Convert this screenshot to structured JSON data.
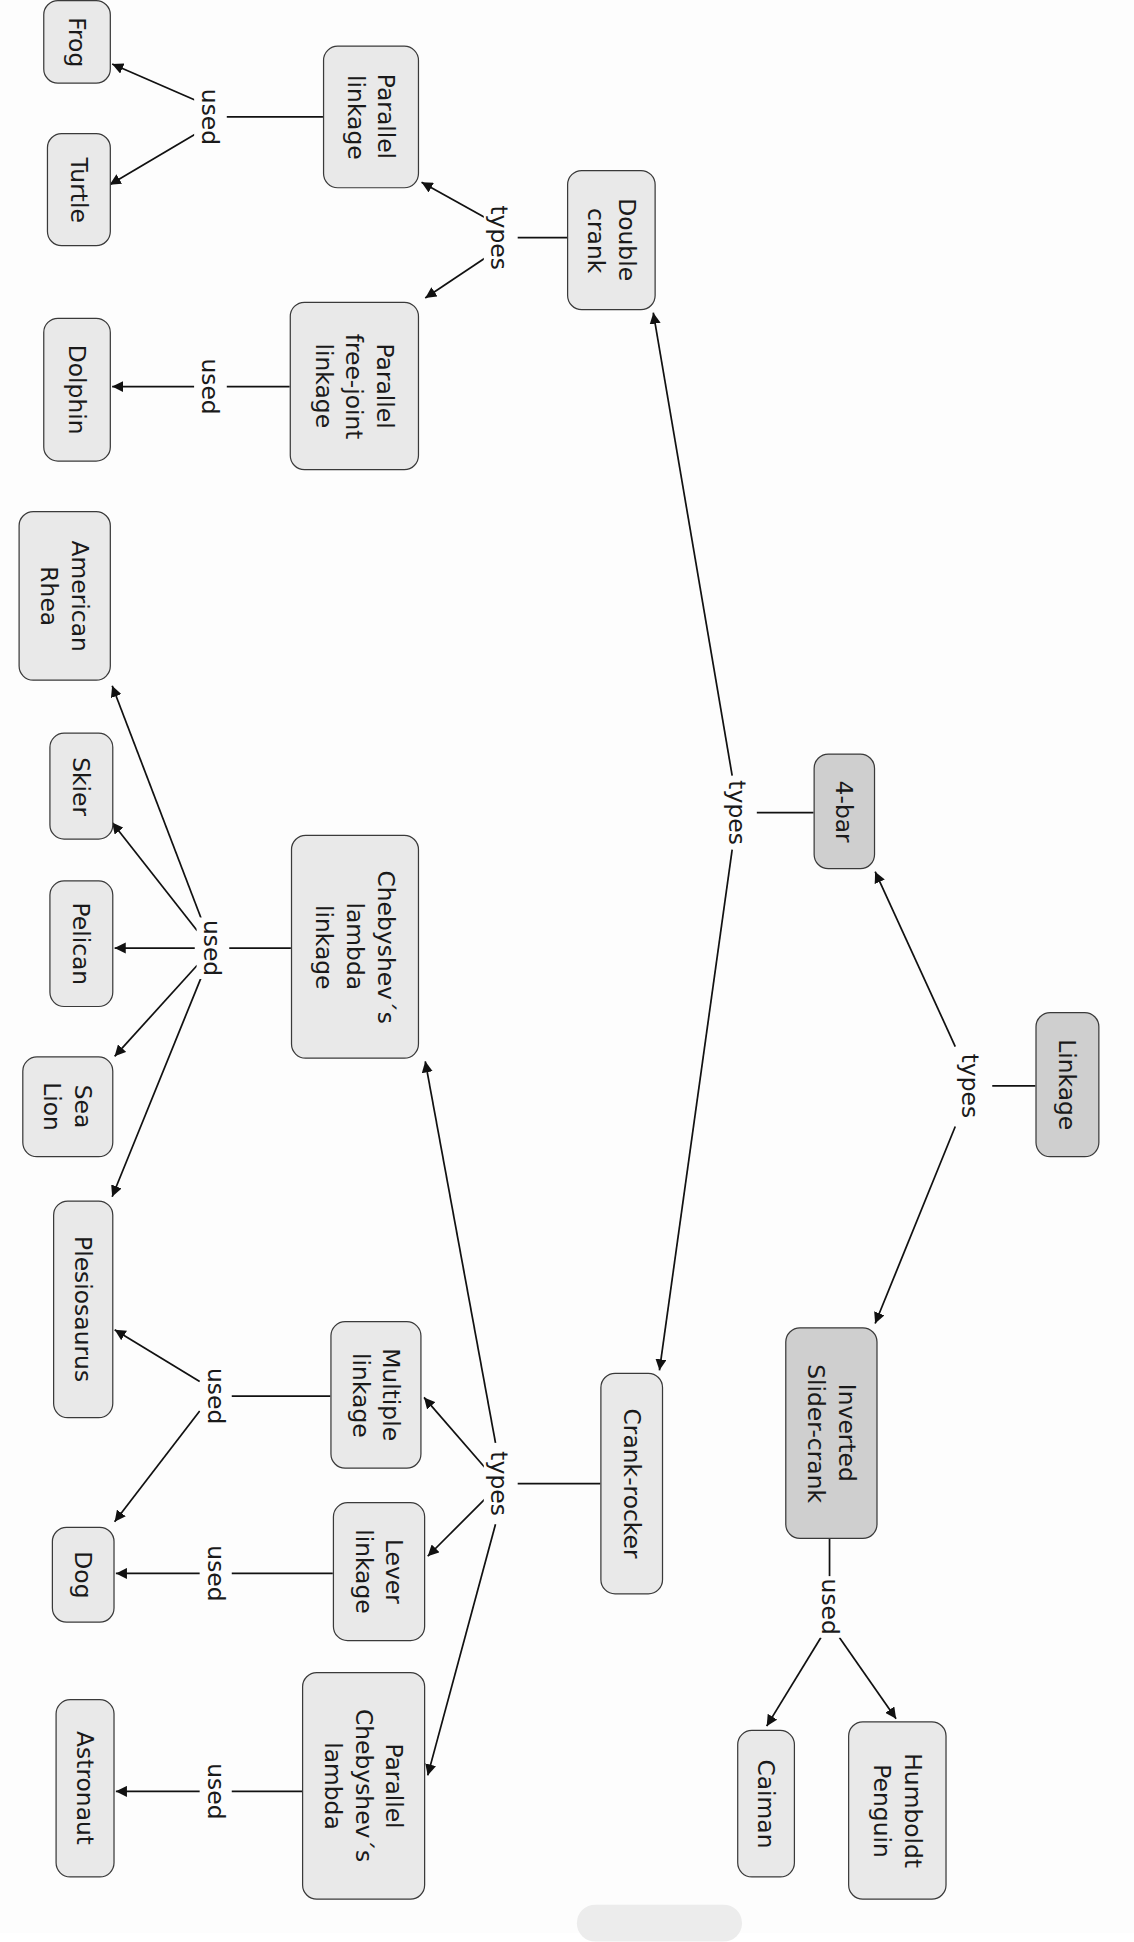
{
  "diagram": {
    "type": "concept-map",
    "orientation": "rotated-90-cw",
    "colors": {
      "node_fill": "#e9e9e9",
      "node_fill_dark": "#cfcfcf",
      "stroke": "#3a3a3a",
      "text": "#1a1a1a"
    },
    "nodes": [
      {
        "id": "linkage",
        "label": "Linkage",
        "box": [
          840,
          822,
          892,
          940
        ],
        "dark": true
      },
      {
        "id": "four_bar",
        "label": "4-bar",
        "box": [
          660,
          612,
          710,
          706
        ],
        "dark": true
      },
      {
        "id": "inverted_slider_crank",
        "label": "Inverted\nSlider-crank",
        "box": [
          637,
          1078,
          712,
          1250
        ],
        "dark": true
      },
      {
        "id": "double_crank",
        "label": "Double\ncrank",
        "box": [
          460,
          138,
          532,
          252
        ],
        "dark": false
      },
      {
        "id": "crank_rocker",
        "label": "Crank-rocker",
        "box": [
          487,
          1115,
          538,
          1295
        ],
        "dark": false
      },
      {
        "id": "parallel_linkage",
        "label": "Parallel\nlinkage",
        "box": [
          262,
          37,
          340,
          153
        ],
        "dark": false
      },
      {
        "id": "parallel_free_joint_linkage",
        "label": "Parallel\nfree-joint\nlinkage",
        "box": [
          235,
          245,
          340,
          382
        ],
        "dark": false
      },
      {
        "id": "chebyshev_lambda_linkage",
        "label": "Chebyshev´s\nlambda\nlinkage",
        "box": [
          236,
          678,
          340,
          860
        ],
        "dark": false
      },
      {
        "id": "multiple_linkage",
        "label": "Multiple\nlinkage",
        "box": [
          268,
          1073,
          342,
          1193
        ],
        "dark": false
      },
      {
        "id": "lever_linkage",
        "label": "Lever\nlinkage",
        "box": [
          270,
          1220,
          345,
          1333
        ],
        "dark": false
      },
      {
        "id": "parallel_chebyshev_lambda",
        "label": "Parallel\nChebyshev´s\nlambda",
        "box": [
          245,
          1358,
          345,
          1543
        ],
        "dark": false
      },
      {
        "id": "frog",
        "label": "Frog",
        "box": [
          35,
          0,
          90,
          68
        ],
        "dark": false
      },
      {
        "id": "turtle",
        "label": "Turtle",
        "box": [
          38,
          108,
          90,
          200
        ],
        "dark": false
      },
      {
        "id": "dolphin",
        "label": "Dolphin",
        "box": [
          35,
          258,
          90,
          375
        ],
        "dark": false
      },
      {
        "id": "american_rhea",
        "label": "American\nRhea",
        "box": [
          15,
          415,
          90,
          553
        ],
        "dark": false
      },
      {
        "id": "skier",
        "label": "Skier",
        "box": [
          40,
          595,
          92,
          682
        ],
        "dark": false
      },
      {
        "id": "pelican",
        "label": "Pelican",
        "box": [
          40,
          715,
          92,
          818
        ],
        "dark": false
      },
      {
        "id": "sea_lion",
        "label": "Sea\nLion",
        "box": [
          18,
          858,
          92,
          940
        ],
        "dark": false
      },
      {
        "id": "plesiosaurus",
        "label": "Plesiosaurus",
        "box": [
          43,
          975,
          92,
          1152
        ],
        "dark": false
      },
      {
        "id": "dog",
        "label": "Dog",
        "box": [
          42,
          1240,
          93,
          1318
        ],
        "dark": false
      },
      {
        "id": "astronaut",
        "label": "Astronaut",
        "box": [
          45,
          1380,
          93,
          1525
        ],
        "dark": false
      },
      {
        "id": "caiman",
        "label": "Caiman",
        "box": [
          598,
          1405,
          645,
          1525
        ],
        "dark": false
      },
      {
        "id": "humboldt_penguin",
        "label": "Humboldt\nPenguin",
        "box": [
          688,
          1398,
          768,
          1543
        ],
        "dark": false
      }
    ],
    "link_labels": [
      {
        "text": "types",
        "pos": [
          787,
          882
        ]
      },
      {
        "text": "types",
        "pos": [
          598,
          660
        ]
      },
      {
        "text": "types",
        "pos": [
          405,
          193
        ]
      },
      {
        "text": "types",
        "pos": [
          405,
          1205
        ]
      },
      {
        "text": "used",
        "pos": [
          170,
          95
        ]
      },
      {
        "text": "used",
        "pos": [
          170,
          314
        ]
      },
      {
        "text": "used",
        "pos": [
          172,
          770
        ]
      },
      {
        "text": "used",
        "pos": [
          175,
          1134
        ]
      },
      {
        "text": "used",
        "pos": [
          175,
          1278
        ]
      },
      {
        "text": "used",
        "pos": [
          175,
          1455
        ]
      },
      {
        "text": "used",
        "pos": [
          673,
          1305
        ]
      }
    ],
    "edges": [
      {
        "from": [
          840,
          882
        ],
        "to": [
          805,
          882
        ],
        "arrow": false
      },
      {
        "from": [
          775,
          850
        ],
        "to": [
          710,
          708
        ],
        "arrow": true
      },
      {
        "from": [
          775,
          915
        ],
        "to": [
          710,
          1075
        ],
        "arrow": true
      },
      {
        "from": [
          660,
          660
        ],
        "to": [
          614,
          660
        ],
        "arrow": false
      },
      {
        "from": [
          594,
          630
        ],
        "to": [
          530,
          254
        ],
        "arrow": true
      },
      {
        "from": [
          594,
          690
        ],
        "to": [
          535,
          1113
        ],
        "arrow": true
      },
      {
        "from": [
          460,
          193
        ],
        "to": [
          420,
          193
        ],
        "arrow": false
      },
      {
        "from": [
          396,
          178
        ],
        "to": [
          342,
          148
        ],
        "arrow": true
      },
      {
        "from": [
          396,
          208
        ],
        "to": [
          345,
          242
        ],
        "arrow": true
      },
      {
        "from": [
          262,
          95
        ],
        "to": [
          184,
          95
        ],
        "arrow": false
      },
      {
        "from": [
          160,
          82
        ],
        "to": [
          91,
          52
        ],
        "arrow": true
      },
      {
        "from": [
          160,
          108
        ],
        "to": [
          89,
          150
        ],
        "arrow": true
      },
      {
        "from": [
          235,
          314
        ],
        "to": [
          184,
          314
        ],
        "arrow": false
      },
      {
        "from": [
          158,
          314
        ],
        "to": [
          91,
          314
        ],
        "arrow": true
      },
      {
        "from": [
          236,
          770
        ],
        "to": [
          186,
          770
        ],
        "arrow": false
      },
      {
        "from": [
          164,
          748
        ],
        "to": [
          91,
          557
        ],
        "arrow": true
      },
      {
        "from": [
          160,
          756
        ],
        "to": [
          91,
          668
        ],
        "arrow": true
      },
      {
        "from": [
          158,
          770
        ],
        "to": [
          93,
          770
        ],
        "arrow": true
      },
      {
        "from": [
          160,
          784
        ],
        "to": [
          93,
          858
        ],
        "arrow": true
      },
      {
        "from": [
          164,
          792
        ],
        "to": [
          91,
          972
        ],
        "arrow": true
      },
      {
        "from": [
          487,
          1205
        ],
        "to": [
          420,
          1205
        ],
        "arrow": false
      },
      {
        "from": [
          402,
          1172
        ],
        "to": [
          345,
          862
        ],
        "arrow": true
      },
      {
        "from": [
          396,
          1195
        ],
        "to": [
          344,
          1135
        ],
        "arrow": true
      },
      {
        "from": [
          396,
          1215
        ],
        "to": [
          347,
          1264
        ],
        "arrow": true
      },
      {
        "from": [
          402,
          1238
        ],
        "to": [
          347,
          1442
        ],
        "arrow": true
      },
      {
        "from": [
          268,
          1134
        ],
        "to": [
          188,
          1134
        ],
        "arrow": false
      },
      {
        "from": [
          162,
          1122
        ],
        "to": [
          93,
          1080
        ],
        "arrow": true
      },
      {
        "from": [
          162,
          1146
        ],
        "to": [
          93,
          1236
        ],
        "arrow": true
      },
      {
        "from": [
          270,
          1278
        ],
        "to": [
          188,
          1278
        ],
        "arrow": false
      },
      {
        "from": [
          162,
          1278
        ],
        "to": [
          94,
          1278
        ],
        "arrow": true
      },
      {
        "from": [
          245,
          1455
        ],
        "to": [
          188,
          1455
        ],
        "arrow": false
      },
      {
        "from": [
          162,
          1455
        ],
        "to": [
          94,
          1455
        ],
        "arrow": true
      },
      {
        "from": [
          673,
          1250
        ],
        "to": [
          673,
          1282
        ],
        "arrow": false
      },
      {
        "from": [
          666,
          1330
        ],
        "to": [
          622,
          1402
        ],
        "arrow": true
      },
      {
        "from": [
          681,
          1330
        ],
        "to": [
          727,
          1396
        ],
        "arrow": true
      }
    ]
  }
}
